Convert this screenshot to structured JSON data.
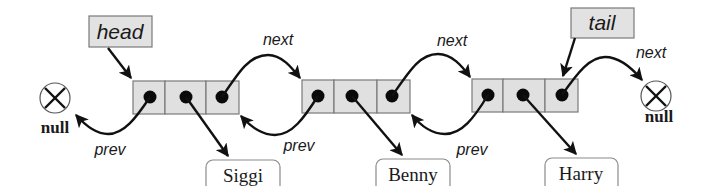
{
  "diagram": {
    "pointers": {
      "head": "head",
      "tail": "tail"
    },
    "link_labels": {
      "next": "next",
      "prev": "prev"
    },
    "null_label": "null",
    "nodes": [
      {
        "data": "Siggi",
        "next_label": "next",
        "prev_label": "prev"
      },
      {
        "data": "Benny",
        "next_label": "next",
        "prev_label": "prev"
      },
      {
        "data": "Harry",
        "next_label": "next",
        "prev_label": "prev"
      }
    ],
    "colors": {
      "cell_fill": "#e0e0e0",
      "cell_border": "#7a7a7a",
      "arrow": "#111111",
      "background": "#ffffff"
    }
  }
}
